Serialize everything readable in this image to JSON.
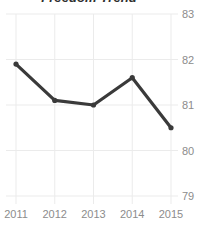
{
  "chart_data": {
    "type": "line",
    "title": "Freedom Trend",
    "xlabel": "",
    "ylabel": "",
    "categories": [
      "2011",
      "2012",
      "2013",
      "2014",
      "2015"
    ],
    "x": [
      2011,
      2012,
      2013,
      2014,
      2015
    ],
    "values": [
      81.9,
      81.1,
      81.0,
      81.6,
      80.5
    ],
    "series": [
      {
        "name": "Freedom Trend",
        "values": [
          81.9,
          81.1,
          81.0,
          81.6,
          80.5
        ]
      }
    ],
    "ylim": [
      79,
      83
    ],
    "yticks": [
      83,
      82,
      81,
      80,
      79
    ],
    "ytick_labels": [
      "83",
      "82",
      "81",
      "80",
      "79"
    ],
    "xticks": [
      2011,
      2012,
      2013,
      2014,
      2015
    ],
    "xtick_labels": [
      "2011",
      "2012",
      "2013",
      "2014",
      "2015"
    ],
    "grid": true,
    "grid_axes": "both",
    "legend": false,
    "legend_position": "none",
    "markers": true,
    "colors": {
      "line": "#3a3a3a",
      "marker": "#3a3a3a",
      "grid": "#ebebeb",
      "tick_label": "#8c8c8c",
      "title": "#2f2f2f",
      "background": "#ffffff"
    }
  }
}
